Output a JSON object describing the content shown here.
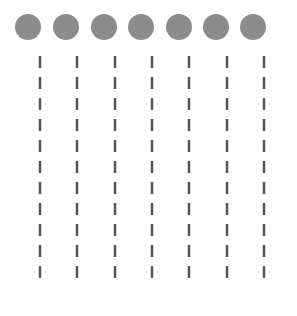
{
  "diagram": {
    "background": "#ffffff",
    "circle_color": "#8c8c8c",
    "dash_color": "#555555",
    "circle_radius": 13,
    "circle_y": 27,
    "circles_x": [
      28,
      66,
      104,
      141,
      179,
      216,
      253
    ],
    "lines_x": [
      40,
      77,
      115,
      152,
      189,
      227,
      264
    ],
    "dash": {
      "start_y": 56,
      "length": 12,
      "period": 21,
      "count": 11,
      "width": 2.5
    }
  }
}
